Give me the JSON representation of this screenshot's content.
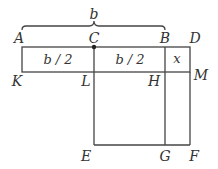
{
  "diagram": {
    "brace_label": "b",
    "points": {
      "A": "A",
      "C": "C",
      "B": "B",
      "D": "D",
      "K": "K",
      "L": "L",
      "H": "H",
      "M": "M",
      "E": "E",
      "G": "G",
      "F": "F"
    },
    "segments": {
      "KL": "b / 2",
      "LH": "b / 2",
      "HM": "x"
    },
    "colors": {
      "stroke": "#444444",
      "text": "#333333",
      "dot": "#222222"
    }
  }
}
